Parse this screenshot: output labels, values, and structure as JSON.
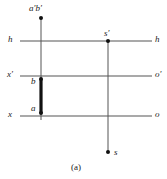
{
  "figure": {
    "caption": "(a)",
    "background_color": "#ffffff",
    "line_color": "#555555",
    "bold_segment_color": "#111111",
    "point_color": "#111111",
    "labels": {
      "top_point": "a′b′",
      "ground_line_left": "h",
      "ground_line_right": "h",
      "station_top": "s′",
      "axis_left_mid": "x′",
      "axis_right_mid": "o′",
      "point_b": "b",
      "point_a": "a",
      "axis_left_bottom": "x",
      "axis_right_bottom": "o",
      "station_bottom": "s"
    },
    "geometry": {
      "horizontal_lines": [
        {
          "name": "h-h",
          "y": 41,
          "x_start": 20,
          "x_end": 152
        },
        {
          "name": "x'-o'",
          "y": 76,
          "x_start": 20,
          "x_end": 152
        },
        {
          "name": "x-o",
          "y": 116,
          "x_start": 20,
          "x_end": 152
        }
      ],
      "vertical_lines": [
        {
          "name": "left-projector",
          "x": 41,
          "y_start": 18,
          "y_end": 120
        },
        {
          "name": "right-projector",
          "x": 108,
          "y_start": 41,
          "y_end": 152
        }
      ],
      "bold_segment": {
        "x": 41,
        "y_start": 79,
        "y_end": 113
      },
      "points": [
        {
          "name": "a'b'",
          "x": 41,
          "y": 18
        },
        {
          "name": "b",
          "x": 41,
          "y": 79
        },
        {
          "name": "a",
          "x": 41,
          "y": 113
        },
        {
          "name": "s'",
          "x": 108,
          "y": 41
        },
        {
          "name": "s",
          "x": 108,
          "y": 152
        }
      ]
    }
  }
}
